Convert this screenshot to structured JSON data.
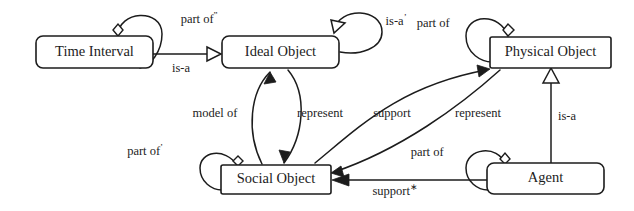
{
  "diagram": {
    "type": "uml-class-diagram",
    "background_color": "#ffffff",
    "line_color": "#1c1c1c",
    "nodes": [
      {
        "id": "time_interval",
        "label": "Time Interval",
        "shape": "rounded-rect",
        "x": 36,
        "y": 36,
        "w": 117,
        "h": 32
      },
      {
        "id": "ideal_object",
        "label": "Ideal Object",
        "shape": "rounded-rect",
        "x": 222,
        "y": 36,
        "w": 117,
        "h": 32
      },
      {
        "id": "physical_object",
        "label": "Physical Object",
        "shape": "rect",
        "x": 490,
        "y": 37,
        "w": 121,
        "h": 31
      },
      {
        "id": "social_object",
        "label": "Social Object",
        "shape": "rect",
        "x": 221,
        "y": 165,
        "w": 110,
        "h": 29
      },
      {
        "id": "agent",
        "label": "Agent",
        "shape": "rounded-rect",
        "x": 487,
        "y": 163,
        "w": 117,
        "h": 31
      }
    ],
    "edges": [
      {
        "id": "e1",
        "label": "part of",
        "superscript": "”",
        "from": "time_interval",
        "to": "time_interval",
        "kind": "aggregation-self"
      },
      {
        "id": "e2",
        "label": "is-a",
        "superscript": "",
        "from": "time_interval",
        "to": "ideal_object",
        "kind": "generalization"
      },
      {
        "id": "e3",
        "label": "is-a",
        "superscript": "’",
        "from": "ideal_object",
        "to": "ideal_object",
        "kind": "generalization-self"
      },
      {
        "id": "e4",
        "label": "part of",
        "superscript": "",
        "from": "physical_object",
        "to": "physical_object",
        "kind": "aggregation-self"
      },
      {
        "id": "e5",
        "label": "model of",
        "superscript": "",
        "from": "social_object",
        "to": "ideal_object",
        "kind": "association"
      },
      {
        "id": "e6",
        "label": "represent",
        "superscript": "",
        "from": "ideal_object",
        "to": "social_object",
        "kind": "association"
      },
      {
        "id": "e7",
        "label": "support",
        "superscript": "",
        "from": "social_object",
        "to": "physical_object",
        "kind": "association"
      },
      {
        "id": "e8",
        "label": "represent",
        "superscript": "",
        "from": "physical_object",
        "to": "social_object",
        "kind": "association"
      },
      {
        "id": "e9",
        "label": "part of",
        "superscript": "’",
        "from": "social_object",
        "to": "social_object",
        "kind": "aggregation-self"
      },
      {
        "id": "e10",
        "label": "part of",
        "superscript": "",
        "from": "agent",
        "to": "agent",
        "kind": "aggregation-self"
      },
      {
        "id": "e11",
        "label": "support",
        "superscript": "∗",
        "from": "agent",
        "to": "social_object",
        "kind": "association"
      },
      {
        "id": "e12",
        "label": "is-a",
        "superscript": "",
        "from": "agent",
        "to": "physical_object",
        "kind": "generalization"
      }
    ]
  }
}
